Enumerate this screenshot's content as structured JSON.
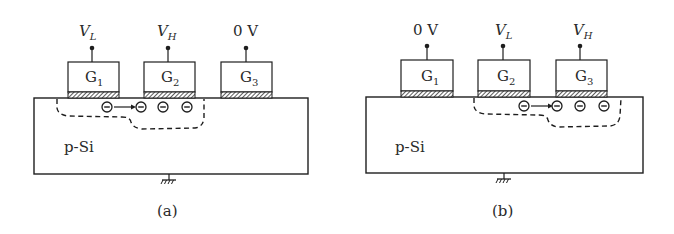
{
  "panels": [
    {
      "caption": "(a)",
      "substrate_label": "p-Si",
      "gates": [
        {
          "name": "G",
          "sub": "1",
          "voltage_main": "V",
          "voltage_sub": "L"
        },
        {
          "name": "G",
          "sub": "2",
          "voltage_main": "V",
          "voltage_sub": "H"
        },
        {
          "name": "G",
          "sub": "3",
          "voltage_main": "0 V",
          "voltage_sub": ""
        }
      ],
      "charges": "electrons move from G1 region to G2 potential well",
      "electron_symbol": "⊖"
    },
    {
      "caption": "(b)",
      "substrate_label": "p-Si",
      "gates": [
        {
          "name": "G",
          "sub": "1",
          "voltage_main": "0 V",
          "voltage_sub": ""
        },
        {
          "name": "G",
          "sub": "2",
          "voltage_main": "V",
          "voltage_sub": "L"
        },
        {
          "name": "G",
          "sub": "3",
          "voltage_main": "V",
          "voltage_sub": "H"
        }
      ],
      "charges": "electrons move from G2 region to G3 potential well",
      "electron_symbol": "⊖"
    }
  ],
  "colors": {
    "line": "#1e1e1e",
    "background": "#ffffff"
  }
}
